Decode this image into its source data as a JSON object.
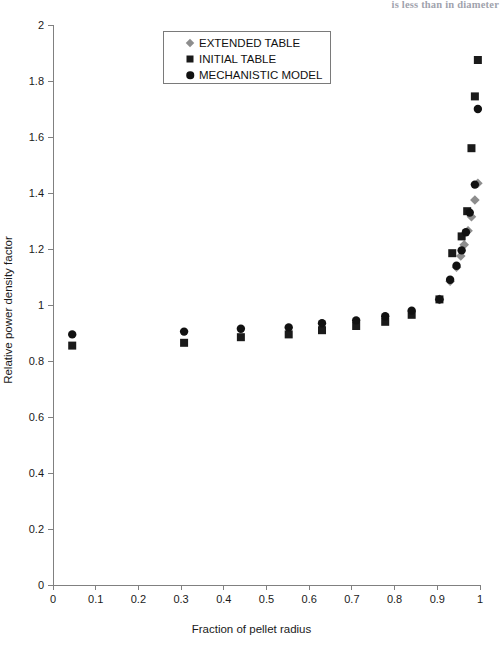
{
  "page": {
    "top_fragment": "is less than in diameter"
  },
  "chart_data": {
    "type": "scatter",
    "title": "",
    "xlabel": "Fraction of pellet radius",
    "ylabel": "Relative power density factor",
    "xlim": [
      0,
      1
    ],
    "ylim": [
      0,
      2
    ],
    "xticks": [
      "0",
      "0.1",
      "0.2",
      "0.3",
      "0.4",
      "0.5",
      "0.6",
      "0.7",
      "0.8",
      "0.9",
      "1"
    ],
    "yticks": [
      "0",
      "0.2",
      "0.4",
      "0.6",
      "0.8",
      "1",
      "1.2",
      "1.4",
      "1.6",
      "1.8",
      "2"
    ],
    "xtick_values": [
      0,
      0.1,
      0.2,
      0.3,
      0.4,
      0.5,
      0.6,
      0.7,
      0.8,
      0.9,
      1
    ],
    "ytick_values": [
      0,
      0.2,
      0.4,
      0.6,
      0.8,
      1,
      1.2,
      1.4,
      1.6,
      1.8,
      2
    ],
    "grid": false,
    "legend_position": "top-center",
    "series": [
      {
        "name": "EXTENDED TABLE",
        "marker": "diamond",
        "color": "#8d8d8d",
        "points": [
          [
            0.905,
            1.02
          ],
          [
            0.93,
            1.085
          ],
          [
            0.945,
            1.135
          ],
          [
            0.955,
            1.175
          ],
          [
            0.963,
            1.215
          ],
          [
            0.972,
            1.265
          ],
          [
            0.98,
            1.315
          ],
          [
            0.988,
            1.375
          ],
          [
            0.995,
            1.435
          ]
        ]
      },
      {
        "name": "INITIAL TABLE",
        "marker": "square",
        "color": "#1a1a1a",
        "points": [
          [
            0.045,
            0.855
          ],
          [
            0.307,
            0.865
          ],
          [
            0.44,
            0.885
          ],
          [
            0.552,
            0.895
          ],
          [
            0.63,
            0.91
          ],
          [
            0.71,
            0.925
          ],
          [
            0.778,
            0.94
          ],
          [
            0.84,
            0.965
          ],
          [
            0.905,
            1.02
          ],
          [
            0.935,
            1.185
          ],
          [
            0.957,
            1.245
          ],
          [
            0.97,
            1.335
          ],
          [
            0.98,
            1.56
          ],
          [
            0.988,
            1.745
          ],
          [
            0.995,
            1.875
          ]
        ]
      },
      {
        "name": "MECHANISTIC MODEL",
        "marker": "circle",
        "color": "#111111",
        "points": [
          [
            0.045,
            0.895
          ],
          [
            0.307,
            0.905
          ],
          [
            0.44,
            0.915
          ],
          [
            0.552,
            0.92
          ],
          [
            0.63,
            0.935
          ],
          [
            0.71,
            0.945
          ],
          [
            0.778,
            0.96
          ],
          [
            0.84,
            0.98
          ],
          [
            0.905,
            1.02
          ],
          [
            0.93,
            1.09
          ],
          [
            0.945,
            1.14
          ],
          [
            0.957,
            1.195
          ],
          [
            0.967,
            1.26
          ],
          [
            0.976,
            1.33
          ],
          [
            0.988,
            1.43
          ],
          [
            0.995,
            1.7
          ]
        ]
      }
    ]
  }
}
